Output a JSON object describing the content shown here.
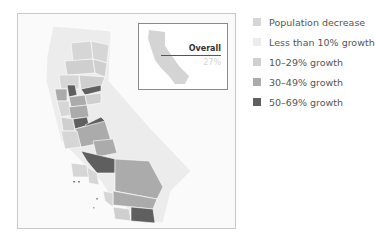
{
  "map": {
    "region": "California counties",
    "inset": {
      "label": "Overall",
      "value": "27%"
    }
  },
  "legend": {
    "items": [
      {
        "label": "Population decrease",
        "color": "#d6d6d6"
      },
      {
        "label": "Less than 10% growth",
        "color": "#ececec"
      },
      {
        "label": "10–29% growth",
        "color": "#cfcfcf"
      },
      {
        "label": "30–49% growth",
        "color": "#ababab"
      },
      {
        "label": "50–69% growth",
        "color": "#5f5f5f"
      }
    ]
  },
  "colors": {
    "decrease": "#d6d6d6",
    "lt10": "#ececec",
    "g10_29": "#cfcfcf",
    "g30_49": "#ababab",
    "g50_69": "#5f5f5f",
    "frame_border": "#c8c8c8"
  }
}
